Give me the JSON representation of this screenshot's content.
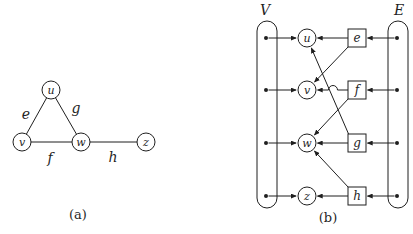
{
  "colors": {
    "ink": "#1f1f1f",
    "background": "#ffffff"
  },
  "figure": {
    "panel_a": {
      "caption": "(a)",
      "caption_pos": {
        "x": 78,
        "y": 219
      },
      "vertex_radius": 9,
      "vertices": [
        {
          "id": "u",
          "x": 51,
          "y": 90
        },
        {
          "id": "v",
          "x": 22,
          "y": 142
        },
        {
          "id": "w",
          "x": 81,
          "y": 142
        },
        {
          "id": "z",
          "x": 146,
          "y": 142
        }
      ],
      "edges": [
        {
          "id": "e",
          "from": "u",
          "to": "v",
          "lx": 26,
          "ly": 114
        },
        {
          "id": "g",
          "from": "u",
          "to": "w",
          "lx": 76,
          "ly": 108
        },
        {
          "id": "f",
          "from": "v",
          "to": "w",
          "lx": 50,
          "ly": 158
        },
        {
          "id": "h",
          "from": "w",
          "to": "z",
          "lx": 113,
          "ly": 157
        }
      ]
    },
    "panel_b": {
      "caption": "(b)",
      "caption_pos": {
        "x": 328,
        "y": 222
      },
      "set_labels": {
        "vertices": "V",
        "edges": "E"
      },
      "pill": {
        "top": 21,
        "bottom": 208,
        "width": 20,
        "corner_radius": 10
      },
      "columns": {
        "v_pill_cx": 267,
        "circle_cx": 307,
        "square_cx": 357,
        "e_pill_cx": 398
      },
      "node_radius": 9,
      "square_size": 18,
      "dot_radius": 2,
      "rows": [
        {
          "vertex": "u",
          "edge": "e",
          "y": 38
        },
        {
          "vertex": "v",
          "edge": "f",
          "y": 90,
          "hop_x": 333
        },
        {
          "vertex": "w",
          "edge": "g",
          "y": 143
        },
        {
          "vertex": "z",
          "edge": "h",
          "y": 196
        }
      ],
      "incidence": [
        {
          "edge": "e",
          "endpoints": [
            "u",
            "v"
          ]
        },
        {
          "edge": "f",
          "endpoints": [
            "v",
            "w"
          ]
        },
        {
          "edge": "g",
          "endpoints": [
            "w",
            "u"
          ]
        },
        {
          "edge": "h",
          "endpoints": [
            "z",
            "w"
          ]
        }
      ]
    }
  }
}
